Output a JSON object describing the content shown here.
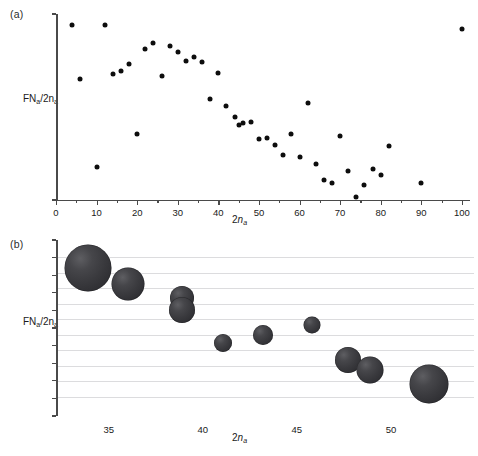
{
  "figure": {
    "panel_a_label": "(a)",
    "panel_b_label": "(b)",
    "y_axis_label_html": "FN<sub>a</sub>/2n<sub>a</sub>",
    "x_axis_label_html": "2n<sub>a</sub>"
  },
  "chart_data": [
    {
      "type": "scatter",
      "panel": "(a)",
      "title": "",
      "xlabel": "2na",
      "ylabel": "FNa/2na",
      "xlim": [
        0,
        102
      ],
      "ylim": [
        0,
        1.06
      ],
      "grid": false,
      "legend": null,
      "x_ticks": [
        0,
        10,
        20,
        30,
        40,
        50,
        60,
        70,
        80,
        90,
        100
      ],
      "x_minor_ticks": [
        5,
        15,
        25,
        35,
        45,
        55,
        65,
        75,
        85,
        95
      ],
      "y_ticks_labeled": [],
      "y_tick_count": 2,
      "marker": "filled-circle",
      "marker_color": "#0d0d0d",
      "marker_size_px": 5,
      "points": [
        {
          "x": 4,
          "y": 1.0
        },
        {
          "x": 6,
          "y": 0.69
        },
        {
          "x": 10,
          "y": 0.19
        },
        {
          "x": 12,
          "y": 1.0
        },
        {
          "x": 14,
          "y": 0.72
        },
        {
          "x": 16,
          "y": 0.735
        },
        {
          "x": 18,
          "y": 0.775
        },
        {
          "x": 20,
          "y": 0.375
        },
        {
          "x": 22,
          "y": 0.86
        },
        {
          "x": 24,
          "y": 0.895
        },
        {
          "x": 26,
          "y": 0.705
        },
        {
          "x": 28,
          "y": 0.875
        },
        {
          "x": 30,
          "y": 0.845
        },
        {
          "x": 32,
          "y": 0.79
        },
        {
          "x": 34,
          "y": 0.815
        },
        {
          "x": 36,
          "y": 0.785
        },
        {
          "x": 38,
          "y": 0.575
        },
        {
          "x": 40,
          "y": 0.725
        },
        {
          "x": 42,
          "y": 0.535
        },
        {
          "x": 44,
          "y": 0.475
        },
        {
          "x": 45,
          "y": 0.425
        },
        {
          "x": 46,
          "y": 0.44
        },
        {
          "x": 48,
          "y": 0.445
        },
        {
          "x": 50,
          "y": 0.345
        },
        {
          "x": 52,
          "y": 0.355
        },
        {
          "x": 54,
          "y": 0.315
        },
        {
          "x": 56,
          "y": 0.255
        },
        {
          "x": 58,
          "y": 0.375
        },
        {
          "x": 60,
          "y": 0.245
        },
        {
          "x": 62,
          "y": 0.555
        },
        {
          "x": 64,
          "y": 0.205
        },
        {
          "x": 66,
          "y": 0.115
        },
        {
          "x": 68,
          "y": 0.095
        },
        {
          "x": 70,
          "y": 0.365
        },
        {
          "x": 72,
          "y": 0.165
        },
        {
          "x": 74,
          "y": 0.015
        },
        {
          "x": 76,
          "y": 0.085
        },
        {
          "x": 78,
          "y": 0.175
        },
        {
          "x": 80,
          "y": 0.145
        },
        {
          "x": 82,
          "y": 0.305
        },
        {
          "x": 90,
          "y": 0.095
        },
        {
          "x": 100,
          "y": 0.975
        }
      ]
    },
    {
      "type": "scatter",
      "panel": "(b)",
      "title": "",
      "xlabel": "2na",
      "ylabel": "FNa/2na",
      "xlim": [
        32.2,
        54.2
      ],
      "ylim": [
        0,
        1.0
      ],
      "grid": true,
      "grid_orientation": "horizontal",
      "grid_color": "#dcdcde",
      "grid_line_count": 10,
      "legend": null,
      "x_ticks": [
        35,
        40,
        45,
        50
      ],
      "y_tick_count": 11,
      "marker": "sphere-bubble",
      "marker_color": "#3a3a3e",
      "size_encodes": "sample-count",
      "points": [
        {
          "x": 33.9,
          "y": 0.845,
          "size": 47
        },
        {
          "x": 36.0,
          "y": 0.755,
          "size": 33
        },
        {
          "x": 38.9,
          "y": 0.672,
          "size": 24
        },
        {
          "x": 38.9,
          "y": 0.6,
          "size": 26
        },
        {
          "x": 41.1,
          "y": 0.405,
          "size": 18
        },
        {
          "x": 43.2,
          "y": 0.455,
          "size": 20
        },
        {
          "x": 45.8,
          "y": 0.513,
          "size": 17
        },
        {
          "x": 47.7,
          "y": 0.305,
          "size": 26
        },
        {
          "x": 48.9,
          "y": 0.248,
          "size": 27
        },
        {
          "x": 52.0,
          "y": 0.165,
          "size": 39
        }
      ]
    }
  ]
}
